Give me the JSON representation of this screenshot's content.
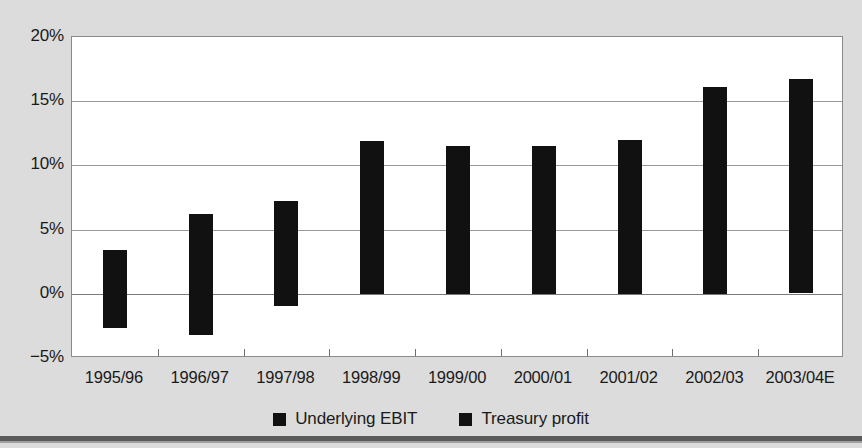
{
  "chart_data": {
    "type": "bar",
    "title": "",
    "subtitle": "",
    "xlabel": "",
    "ylabel": "",
    "ylim": [
      -5,
      20
    ],
    "yticks": [
      -5,
      0,
      5,
      10,
      15,
      20
    ],
    "ytick_labels": [
      "−5%",
      "0%",
      "5%",
      "10%",
      "15%",
      "20%"
    ],
    "grid": true,
    "legend_position": "bottom",
    "stacked": true,
    "categories": [
      "1995/96",
      "1996/97",
      "1997/98",
      "1998/99",
      "1999/00",
      "2000/01",
      "2001/02",
      "2002/03",
      "2003/04E"
    ],
    "series": [
      {
        "name": "Underlying EBIT",
        "color": "#111111",
        "values": [
          3.4,
          6.2,
          7.2,
          11.9,
          11.5,
          11.5,
          12.0,
          9.6,
          9.9
        ]
      },
      {
        "name": "Treasury profit",
        "color": "#111111",
        "values": [
          -2.7,
          -3.2,
          -1.0,
          0.0,
          0.0,
          0.0,
          0.0,
          6.5,
          6.8
        ]
      }
    ],
    "bars": [
      {
        "category": "1995/96",
        "top": 3.4,
        "bottom": -2.7,
        "split": 0.0
      },
      {
        "category": "1996/97",
        "top": 6.2,
        "bottom": -3.2,
        "split": 0.0
      },
      {
        "category": "1997/98",
        "top": 7.2,
        "bottom": -1.0,
        "split": 0.0
      },
      {
        "category": "1998/99",
        "top": 11.9,
        "bottom": 0.0,
        "split": null
      },
      {
        "category": "1999/00",
        "top": 11.5,
        "bottom": 0.0,
        "split": null
      },
      {
        "category": "2000/01",
        "top": 11.5,
        "bottom": 0.0,
        "split": null
      },
      {
        "category": "2001/02",
        "top": 12.0,
        "bottom": 0.0,
        "split": null
      },
      {
        "category": "2002/03",
        "top": 16.1,
        "bottom": 0.0,
        "split": 9.6
      },
      {
        "category": "2003/04E",
        "top": 16.7,
        "bottom": 0.0,
        "split": 9.9
      }
    ]
  },
  "legend": {
    "items": [
      {
        "label": "Underlying EBIT"
      },
      {
        "label": "Treasury profit"
      }
    ]
  },
  "colors": {
    "background": "#dcdcdc",
    "plot_background": "#ffffff",
    "bar": "#111111",
    "gridline": "#9a9a9a",
    "axis": "#8a8a8a",
    "text": "#1a1a1a"
  }
}
